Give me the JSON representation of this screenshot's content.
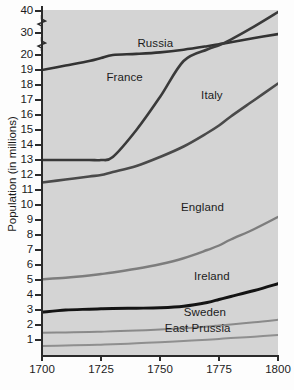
{
  "chart_data": {
    "type": "line",
    "title": "",
    "xlabel": "",
    "ylabel": "Population (in millions)",
    "xlim": [
      1700,
      1800
    ],
    "ylim": [
      0,
      40
    ],
    "grid": false,
    "legend_position": "inline-labels",
    "note": "Y axis is broken: linear 0-20, then compressed jumps to 30 and 40",
    "x_ticks": [
      {
        "value": 1700,
        "label": "1700"
      },
      {
        "value": 1725,
        "label": "1725"
      },
      {
        "value": 1750,
        "label": "1750"
      },
      {
        "value": 1775,
        "label": "1775"
      },
      {
        "value": 1800,
        "label": "1800"
      }
    ],
    "y_ticks": [
      {
        "value": 40,
        "label": "40"
      },
      {
        "value": 30,
        "label": "30"
      },
      {
        "value": 20,
        "label": "20"
      },
      {
        "value": 19,
        "label": "19"
      },
      {
        "value": 18,
        "label": "18"
      },
      {
        "value": 17,
        "label": "17"
      },
      {
        "value": 16,
        "label": "16"
      },
      {
        "value": 15,
        "label": "15"
      },
      {
        "value": 14,
        "label": "14"
      },
      {
        "value": 13,
        "label": "13"
      },
      {
        "value": 12,
        "label": "12"
      },
      {
        "value": 11,
        "label": "11"
      },
      {
        "value": 10,
        "label": "10"
      },
      {
        "value": 9,
        "label": "9"
      },
      {
        "value": 8,
        "label": "8"
      },
      {
        "value": 7,
        "label": "7"
      },
      {
        "value": 6,
        "label": "6"
      },
      {
        "value": 5,
        "label": "5"
      },
      {
        "value": 4,
        "label": "4"
      },
      {
        "value": 3,
        "label": "3"
      },
      {
        "value": 2,
        "label": "2"
      },
      {
        "value": 1,
        "label": "1"
      }
    ],
    "x": [
      1700,
      1710,
      1720,
      1725,
      1730,
      1740,
      1750,
      1760,
      1770,
      1775,
      1780,
      1790,
      1800
    ],
    "series": [
      {
        "name": "France",
        "color": "#333333",
        "width": 2.6,
        "values": [
          19.0,
          19.3,
          19.6,
          19.8,
          20.0,
          20.5,
          21.2,
          22.4,
          24.0,
          24.9,
          25.8,
          27.7,
          29.5
        ],
        "label_x": 1735,
        "label_y": 18.0
      },
      {
        "name": "Russia",
        "color": "#3a3a3a",
        "width": 2.6,
        "values": [
          13.0,
          13.0,
          13.0,
          13.0,
          13.2,
          15.0,
          17.2,
          19.6,
          22.5,
          24.4,
          27.0,
          33.0,
          39.5
        ],
        "label_x": 1748,
        "label_y": 21.6
      },
      {
        "name": "Italy",
        "color": "#4a4a4a",
        "width": 2.6,
        "values": [
          11.5,
          11.7,
          11.9,
          12.0,
          12.2,
          12.6,
          13.2,
          13.9,
          14.8,
          15.3,
          15.9,
          17.0,
          18.1
        ],
        "label_x": 1772,
        "label_y": 16.8
      },
      {
        "name": "England",
        "color": "#7d7d7d",
        "width": 2.4,
        "values": [
          5.05,
          5.15,
          5.3,
          5.4,
          5.5,
          5.75,
          6.05,
          6.45,
          7.0,
          7.3,
          7.7,
          8.4,
          9.2
        ],
        "label_x": 1768,
        "label_y": 9.35
      },
      {
        "name": "Ireland",
        "color": "#141414",
        "width": 2.9,
        "values": [
          2.85,
          3.0,
          3.05,
          3.08,
          3.1,
          3.12,
          3.15,
          3.25,
          3.5,
          3.7,
          3.9,
          4.3,
          4.75
        ],
        "label_x": 1772,
        "label_y": 4.75
      },
      {
        "name": "Sweden",
        "color": "#8a8a8a",
        "width": 2.0,
        "values": [
          1.48,
          1.5,
          1.53,
          1.55,
          1.58,
          1.63,
          1.7,
          1.78,
          1.9,
          1.97,
          2.04,
          2.18,
          2.35
        ],
        "label_x": 1769,
        "label_y": 2.35
      },
      {
        "name": "East Prussia",
        "color": "#8f8f8f",
        "width": 2.0,
        "values": [
          0.6,
          0.63,
          0.67,
          0.69,
          0.72,
          0.78,
          0.85,
          0.93,
          1.02,
          1.07,
          1.13,
          1.22,
          1.33
        ],
        "label_x": 1766,
        "label_y": 1.25
      }
    ]
  },
  "axis": {
    "y_title": "Population (in millions)"
  }
}
